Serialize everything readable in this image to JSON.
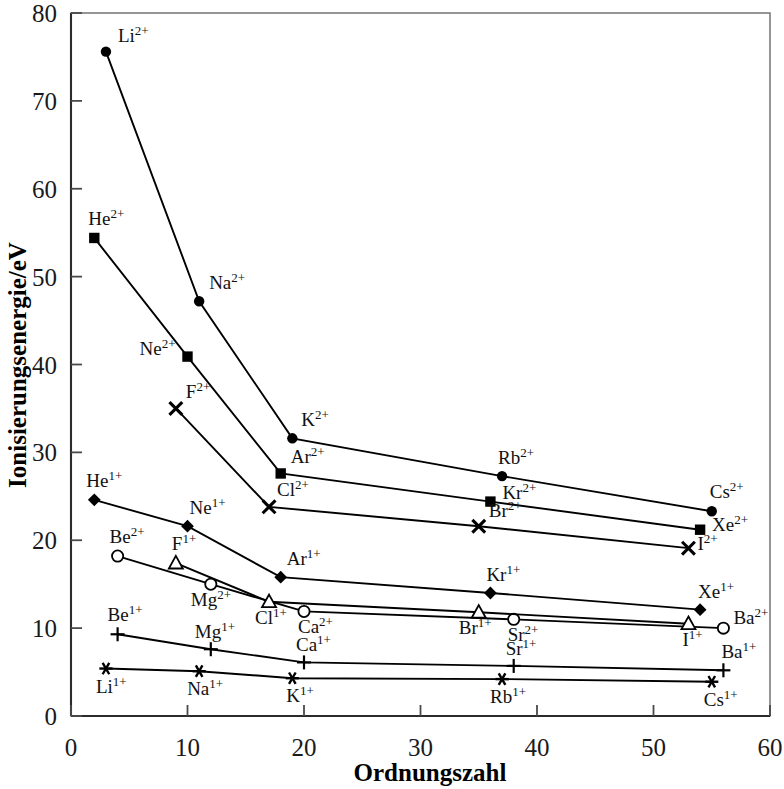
{
  "chart_data": {
    "type": "line",
    "title": "",
    "xlabel": "Ordnungszahl",
    "ylabel": "Ionisierungsenergie/eV",
    "xlim": [
      0,
      60
    ],
    "ylim": [
      0,
      80
    ],
    "xticks": [
      0,
      10,
      20,
      30,
      40,
      50,
      60
    ],
    "yticks": [
      0,
      10,
      20,
      30,
      40,
      50,
      60,
      70,
      80
    ],
    "grid": false,
    "legend": "none (points labelled inline)",
    "series": [
      {
        "name": "Alkalimetalle 2+",
        "marker": "filled-circle",
        "points": [
          {
            "label": "Li",
            "charge": "2+",
            "x": 3,
            "y": 75.6,
            "label_dx": 12,
            "label_dy": -10
          },
          {
            "label": "Na",
            "charge": "2+",
            "x": 11,
            "y": 47.2,
            "label_dx": 10,
            "label_dy": -12
          },
          {
            "label": "K",
            "charge": "2+",
            "x": 19,
            "y": 31.6,
            "label_dx": 9,
            "label_dy": -12
          },
          {
            "label": "Rb",
            "charge": "2+",
            "x": 37,
            "y": 27.3,
            "label_dx": -4,
            "label_dy": -12
          },
          {
            "label": "Cs",
            "charge": "2+",
            "x": 55,
            "y": 23.3,
            "label_dx": -2,
            "label_dy": -13
          }
        ]
      },
      {
        "name": "Edelgase 2+",
        "marker": "filled-square",
        "points": [
          {
            "label": "He",
            "charge": "2+",
            "x": 2,
            "y": 54.4,
            "label_dx": -6,
            "label_dy": -13
          },
          {
            "label": "Ne",
            "charge": "2+",
            "x": 10,
            "y": 40.9,
            "label_dx": -48,
            "label_dy": -2
          },
          {
            "label": "Ar",
            "charge": "2+",
            "x": 18,
            "y": 27.6,
            "label_dx": 10,
            "label_dy": -10
          },
          {
            "label": "Kr",
            "charge": "2+",
            "x": 36,
            "y": 24.4,
            "label_dx": 12,
            "label_dy": -3
          },
          {
            "label": "Xe",
            "charge": "2+",
            "x": 54,
            "y": 21.2,
            "label_dx": 12,
            "label_dy": 1
          }
        ]
      },
      {
        "name": "Halogene 2+",
        "marker": "cross-x",
        "points": [
          {
            "label": "F",
            "charge": "2+",
            "x": 9,
            "y": 35.0,
            "label_dx": 10,
            "label_dy": -10
          },
          {
            "label": "Cl",
            "charge": "2+",
            "x": 17,
            "y": 23.8,
            "label_dx": 8,
            "label_dy": -11
          },
          {
            "label": "Br",
            "charge": "2+",
            "x": 35,
            "y": 21.6,
            "label_dx": 10,
            "label_dy": -9
          },
          {
            "label": "I",
            "charge": "2+",
            "x": 53,
            "y": 19.1,
            "label_dx": 9,
            "label_dy": 2
          }
        ]
      },
      {
        "name": "Erdalkalimetalle 2+",
        "marker": "open-circle",
        "points": [
          {
            "label": "Be",
            "charge": "2+",
            "x": 4,
            "y": 18.2,
            "label_dx": -8,
            "label_dy": -13
          },
          {
            "label": "Mg",
            "charge": "2+",
            "x": 12,
            "y": 15.0,
            "label_dx": -20,
            "label_dy": 22
          },
          {
            "label": "Ca",
            "charge": "2+",
            "x": 20,
            "y": 11.9,
            "label_dx": -6,
            "label_dy": 22
          },
          {
            "label": "Sr",
            "charge": "2+",
            "x": 38,
            "y": 11.0,
            "label_dx": -6,
            "label_dy": 22
          },
          {
            "label": "Ba",
            "charge": "2+",
            "x": 56,
            "y": 10.0,
            "label_dx": 10,
            "label_dy": -4
          }
        ]
      },
      {
        "name": "Edelgase 1+",
        "marker": "filled-diamond",
        "points": [
          {
            "label": "He",
            "charge": "1+",
            "x": 2,
            "y": 24.6,
            "label_dx": -8,
            "label_dy": -13
          },
          {
            "label": "Ne",
            "charge": "1+",
            "x": 10,
            "y": 21.6,
            "label_dx": 2,
            "label_dy": -12
          },
          {
            "label": "Ar",
            "charge": "1+",
            "x": 18,
            "y": 15.8,
            "label_dx": 6,
            "label_dy": -12
          },
          {
            "label": "Kr",
            "charge": "1+",
            "x": 36,
            "y": 14.0,
            "label_dx": -4,
            "label_dy": -12
          },
          {
            "label": "Xe",
            "charge": "1+",
            "x": 54,
            "y": 12.1,
            "label_dx": -2,
            "label_dy": -12
          }
        ]
      },
      {
        "name": "Halogene 1+",
        "marker": "open-triangle",
        "points": [
          {
            "label": "F",
            "charge": "1+",
            "x": 9,
            "y": 17.4,
            "label_dx": -4,
            "label_dy": -13
          },
          {
            "label": "Cl",
            "charge": "1+",
            "x": 17,
            "y": 13.0,
            "label_dx": -14,
            "label_dy": 22
          },
          {
            "label": "Br",
            "charge": "1+",
            "x": 35,
            "y": 11.8,
            "label_dx": -20,
            "label_dy": 22
          },
          {
            "label": "I",
            "charge": "1+",
            "x": 53,
            "y": 10.5,
            "label_dx": -6,
            "label_dy": 22
          }
        ]
      },
      {
        "name": "Erdalkalimetalle 1+",
        "marker": "plus",
        "points": [
          {
            "label": "Be",
            "charge": "1+",
            "x": 4,
            "y": 9.3,
            "label_dx": -10,
            "label_dy": -13
          },
          {
            "label": "Mg",
            "charge": "1+",
            "x": 12,
            "y": 7.6,
            "label_dx": -16,
            "label_dy": -11
          },
          {
            "label": "Ca",
            "charge": "1+",
            "x": 20,
            "y": 6.1,
            "label_dx": -8,
            "label_dy": -11
          },
          {
            "label": "Sr",
            "charge": "1+",
            "x": 38,
            "y": 5.7,
            "label_dx": -8,
            "label_dy": -11
          },
          {
            "label": "Ba",
            "charge": "1+",
            "x": 56,
            "y": 5.2,
            "label_dx": -2,
            "label_dy": -12
          }
        ]
      },
      {
        "name": "Alkalimetalle 1+",
        "marker": "asterisk",
        "points": [
          {
            "label": "Li",
            "charge": "1+",
            "x": 3,
            "y": 5.4,
            "label_dx": -10,
            "label_dy": 24
          },
          {
            "label": "Na",
            "charge": "1+",
            "x": 11,
            "y": 5.1,
            "label_dx": -12,
            "label_dy": 24
          },
          {
            "label": "K",
            "charge": "1+",
            "x": 19,
            "y": 4.3,
            "label_dx": -6,
            "label_dy": 24
          },
          {
            "label": "Rb",
            "charge": "1+",
            "x": 37,
            "y": 4.2,
            "label_dx": -12,
            "label_dy": 24
          },
          {
            "label": "Cs",
            "charge": "1+",
            "x": 55,
            "y": 3.9,
            "label_dx": -8,
            "label_dy": 24
          }
        ]
      }
    ]
  },
  "axes": {
    "x_title": "Ordnungszahl",
    "y_title": "Ionisierungsenergie/eV",
    "x_tick_labels": [
      "0",
      "10",
      "20",
      "30",
      "40",
      "50",
      "60"
    ],
    "y_tick_labels": [
      "0",
      "10",
      "20",
      "30",
      "40",
      "50",
      "60",
      "70",
      "80"
    ]
  },
  "colors": {
    "line": "#000000",
    "frame": "#6a6a6a",
    "text": "#111111",
    "background": "#ffffff"
  }
}
